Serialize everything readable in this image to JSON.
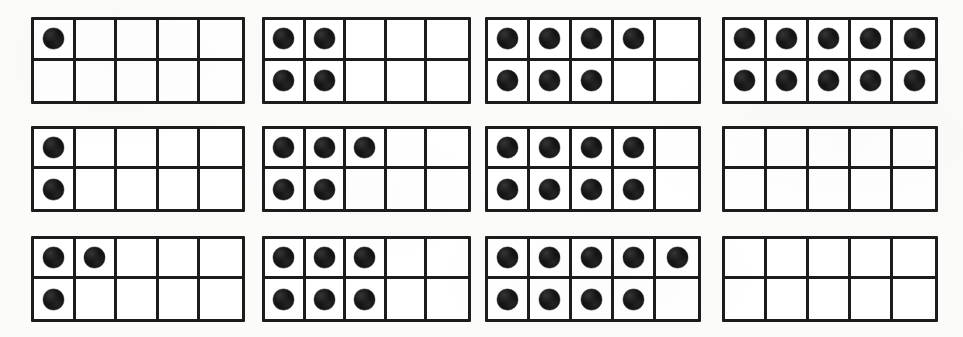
{
  "worksheet": {
    "title": "Ten Frames Counting Worksheet",
    "description": "Twelve ten-frames arranged in a 3 by 4 grid, each showing a number of filled counters",
    "grid_rows": 3,
    "grid_columns": 4,
    "frame_rows": 2,
    "frame_columns": 5,
    "cells_per_frame": 10
  },
  "colors": {
    "page_background": "#fbfbfa",
    "frame_background": "#ffffff",
    "frame_border": "#1c1c1c",
    "counter_fill": "#141414"
  },
  "frames": [
    {
      "id": "ten-frame-1",
      "position": "row-1-col-1",
      "count": 1,
      "top_row_filled": 1,
      "bottom_row_filled": 0
    },
    {
      "id": "ten-frame-2",
      "position": "row-1-col-2",
      "count": 4,
      "top_row_filled": 2,
      "bottom_row_filled": 2
    },
    {
      "id": "ten-frame-3",
      "position": "row-1-col-3",
      "count": 7,
      "top_row_filled": 4,
      "bottom_row_filled": 3
    },
    {
      "id": "ten-frame-4",
      "position": "row-1-col-4",
      "count": 10,
      "top_row_filled": 5,
      "bottom_row_filled": 5
    },
    {
      "id": "ten-frame-5",
      "position": "row-2-col-1",
      "count": 2,
      "top_row_filled": 1,
      "bottom_row_filled": 1
    },
    {
      "id": "ten-frame-6",
      "position": "row-2-col-2",
      "count": 5,
      "top_row_filled": 3,
      "bottom_row_filled": 2
    },
    {
      "id": "ten-frame-7",
      "position": "row-2-col-3",
      "count": 8,
      "top_row_filled": 4,
      "bottom_row_filled": 4
    },
    {
      "id": "ten-frame-8",
      "position": "row-2-col-4",
      "count": 0,
      "top_row_filled": 0,
      "bottom_row_filled": 0
    },
    {
      "id": "ten-frame-9",
      "position": "row-3-col-1",
      "count": 3,
      "top_row_filled": 2,
      "bottom_row_filled": 1
    },
    {
      "id": "ten-frame-10",
      "position": "row-3-col-2",
      "count": 6,
      "top_row_filled": 3,
      "bottom_row_filled": 3
    },
    {
      "id": "ten-frame-11",
      "position": "row-3-col-3",
      "count": 9,
      "top_row_filled": 5,
      "bottom_row_filled": 4
    },
    {
      "id": "ten-frame-12",
      "position": "row-3-col-4",
      "count": 0,
      "top_row_filled": 0,
      "bottom_row_filled": 0
    }
  ]
}
